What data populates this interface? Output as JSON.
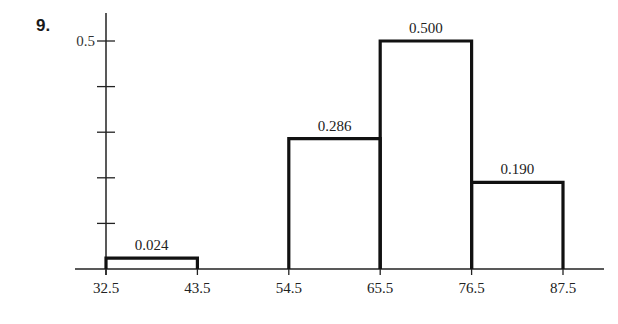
{
  "problem_number": "9.",
  "chart_data": {
    "type": "bar",
    "subtype": "histogram",
    "title": "",
    "xlabel": "",
    "ylabel": "",
    "bin_edges": [
      32.5,
      43.5,
      54.5,
      65.5,
      76.5,
      87.5
    ],
    "x_tick_labels": [
      "32.5",
      "43.5",
      "54.5",
      "65.5",
      "76.5",
      "87.5"
    ],
    "categories": [
      "32.5-43.5",
      "43.5-54.5",
      "54.5-65.5",
      "65.5-76.5",
      "76.5-87.5"
    ],
    "values": [
      0.024,
      0,
      0.286,
      0.5,
      0.19
    ],
    "bar_labels": [
      "0.024",
      "",
      "0.286",
      "0.500",
      "0.190"
    ],
    "y_tick_values": [
      0.1,
      0.2,
      0.3,
      0.4,
      0.5
    ],
    "y_tick_labels": [
      "",
      "",
      "",
      "",
      "0.5"
    ],
    "ylim": [
      0,
      0.55
    ],
    "grid": false,
    "legend": null
  }
}
